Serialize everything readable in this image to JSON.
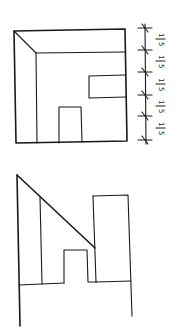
{
  "diagram": {
    "type": "architectural-sketch",
    "figures": [
      {
        "id": "interior-elevation",
        "description": "Room interior perspective: outer frame, receding ceiling/side wall, window on right wall, door at bottom",
        "outer_frame": [
          [
            14,
            31
          ],
          [
            125,
            29
          ],
          [
            127,
            141
          ],
          [
            16,
            143
          ]
        ],
        "ceiling_diagonal": [
          [
            14,
            31
          ],
          [
            36,
            53
          ]
        ],
        "inner_top": [
          [
            36,
            53
          ],
          [
            125,
            52
          ]
        ],
        "inner_left": [
          [
            36,
            53
          ],
          [
            37,
            143
          ]
        ],
        "window": {
          "x1": 89,
          "y1": 75,
          "x2": 125,
          "y2": 98
        },
        "door": {
          "x1": 59,
          "y1": 107,
          "x2": 82,
          "y2": 142
        }
      },
      {
        "id": "section-profile",
        "description": "Profile section with sloping roof, door opening and tall right block",
        "lines": [
          [
            [
              17,
              175
            ],
            [
              19,
              326
            ]
          ],
          [
            [
              17,
              175
            ],
            [
              95,
              248
            ]
          ],
          [
            [
              40,
              197
            ],
            [
              42,
              284
            ]
          ],
          [
            [
              19,
              285
            ],
            [
              64,
              283
            ]
          ],
          [
            [
              64,
              283
            ],
            [
              64,
              250
            ],
            [
              87,
              250
            ],
            [
              88,
              282
            ],
            [
              96,
              282
            ]
          ],
          [
            [
              93,
              196
            ],
            [
              128,
              195
            ],
            [
              132,
              316
            ]
          ],
          [
            [
              93,
              196
            ],
            [
              96,
              282
            ]
          ],
          [
            [
              96,
              282
            ],
            [
              131,
              281
            ]
          ]
        ]
      }
    ],
    "scale": {
      "x": 145,
      "ticks_y": [
        28,
        50,
        72,
        94,
        116,
        140
      ],
      "labels": [
        "1/5",
        "1/5",
        "1/5",
        "1/5",
        "1/5"
      ],
      "label_numerator": "1",
      "label_denominator": "5",
      "label_rotation_deg": 90
    }
  },
  "colors": {
    "line": "#1a1a1a",
    "background": "#ffffff"
  }
}
